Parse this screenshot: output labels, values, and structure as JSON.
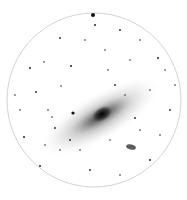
{
  "image": {
    "subject": "Spiral galaxy in negative (inverted) rendering within circular field",
    "colors": {
      "background": "#ffffff",
      "ink": "#111111",
      "circle": "#bbbbbb"
    }
  },
  "field": {
    "cx": 94,
    "cy": 100,
    "r": 87
  },
  "galaxy": {
    "cx": 102,
    "cy": 115,
    "rx": 60,
    "ry": 18,
    "angle": -30
  },
  "companion": {
    "cx": 131,
    "cy": 147
  },
  "bright_star": {
    "cx": 93,
    "cy": 15
  }
}
